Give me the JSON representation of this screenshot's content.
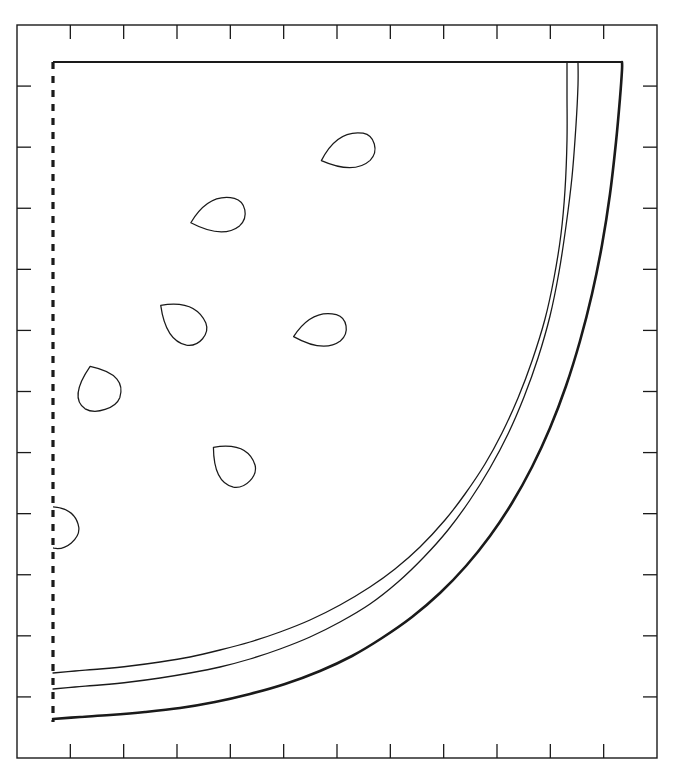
{
  "figure": {
    "title": "",
    "background_color": "#ffffff",
    "line_color": "#1a1a1a",
    "frame": {
      "x0": 17,
      "y0": 25,
      "x1": 657,
      "y1": 758,
      "stroke_width": 1.4
    },
    "axes": {
      "top": {
        "tick_count": 11,
        "tick_length": 14,
        "direction": "inward"
      },
      "bottom": {
        "tick_count": 11,
        "tick_length": 14,
        "direction": "inward"
      },
      "left": {
        "tick_count": 11,
        "tick_length": 14,
        "direction": "inward"
      },
      "right": {
        "tick_count": 11,
        "tick_length": 14,
        "direction": "inward"
      }
    },
    "boundary": {
      "dashed_left_edge": {
        "x": 53,
        "y_top": 62,
        "y_bottom": 722,
        "dash": "7 7",
        "stroke_width": 3.2
      },
      "solid_top_edge": {
        "y": 62,
        "x_left": 53,
        "x_right": 622,
        "stroke_width": 1.8
      }
    }
  },
  "chart_data": {
    "type": "line",
    "title": "",
    "xlabel": "",
    "ylabel": "",
    "xlim": [
      0,
      10
    ],
    "ylim": [
      0,
      10
    ],
    "grid": false,
    "legend": "none",
    "tick_labels": {
      "x": [],
      "y": []
    },
    "series": [
      {
        "name": "curve-inner",
        "stroke_width": 1.3,
        "points": [
          [
            53,
            673
          ],
          [
            75,
            671
          ],
          [
            100,
            669
          ],
          [
            130,
            666
          ],
          [
            160,
            662
          ],
          [
            190,
            657
          ],
          [
            220,
            650
          ],
          [
            250,
            642
          ],
          [
            280,
            632
          ],
          [
            310,
            620
          ],
          [
            340,
            605
          ],
          [
            370,
            587
          ],
          [
            395,
            569
          ],
          [
            420,
            547
          ],
          [
            445,
            520
          ],
          [
            465,
            494
          ],
          [
            485,
            464
          ],
          [
            502,
            433
          ],
          [
            518,
            398
          ],
          [
            532,
            361
          ],
          [
            545,
            319
          ],
          [
            554,
            278
          ],
          [
            561,
            234
          ],
          [
            565,
            190
          ],
          [
            567,
            140
          ],
          [
            567,
            95
          ],
          [
            567,
            62
          ]
        ]
      },
      {
        "name": "curve-middle",
        "stroke_width": 1.3,
        "points": [
          [
            53,
            689
          ],
          [
            75,
            687
          ],
          [
            100,
            685
          ],
          [
            130,
            682
          ],
          [
            160,
            678
          ],
          [
            190,
            673
          ],
          [
            220,
            667
          ],
          [
            250,
            659
          ],
          [
            280,
            649
          ],
          [
            310,
            637
          ],
          [
            340,
            622
          ],
          [
            370,
            604
          ],
          [
            398,
            582
          ],
          [
            424,
            557
          ],
          [
            448,
            530
          ],
          [
            470,
            500
          ],
          [
            490,
            468
          ],
          [
            508,
            434
          ],
          [
            524,
            397
          ],
          [
            538,
            358
          ],
          [
            550,
            316
          ],
          [
            559,
            272
          ],
          [
            566,
            226
          ],
          [
            572,
            177
          ],
          [
            576,
            125
          ],
          [
            578,
            85
          ],
          [
            578,
            62
          ]
        ]
      },
      {
        "name": "curve-outer",
        "stroke_width": 2.6,
        "points": [
          [
            53,
            719
          ],
          [
            80,
            717
          ],
          [
            110,
            715
          ],
          [
            145,
            712
          ],
          [
            180,
            708
          ],
          [
            215,
            702
          ],
          [
            250,
            694
          ],
          [
            285,
            684
          ],
          [
            320,
            671
          ],
          [
            352,
            656
          ],
          [
            382,
            638
          ],
          [
            412,
            617
          ],
          [
            440,
            593
          ],
          [
            466,
            566
          ],
          [
            490,
            536
          ],
          [
            512,
            503
          ],
          [
            532,
            467
          ],
          [
            550,
            428
          ],
          [
            566,
            386
          ],
          [
            580,
            341
          ],
          [
            592,
            294
          ],
          [
            602,
            245
          ],
          [
            610,
            194
          ],
          [
            616,
            142
          ],
          [
            620,
            98
          ],
          [
            622,
            70
          ],
          [
            622,
            62
          ]
        ]
      }
    ],
    "markers": [
      {
        "name": "seed-1",
        "cx": 348,
        "cy": 152,
        "rx": 28,
        "ry": 20,
        "rotation": -18,
        "clipped": false
      },
      {
        "name": "seed-2",
        "cx": 218,
        "cy": 216,
        "rx": 28,
        "ry": 20,
        "rotation": -14,
        "clipped": false
      },
      {
        "name": "seed-3",
        "cx": 182,
        "cy": 322,
        "rx": 27,
        "ry": 21,
        "rotation": 38,
        "clipped": false
      },
      {
        "name": "seed-4",
        "cx": 320,
        "cy": 331,
        "rx": 27,
        "ry": 19,
        "rotation": -12,
        "clipped": false
      },
      {
        "name": "seed-5",
        "cx": 98,
        "cy": 388,
        "rx": 23,
        "ry": 26,
        "rotation": 70,
        "clipped": false
      },
      {
        "name": "seed-6",
        "cx": 232,
        "cy": 464,
        "rx": 25,
        "ry": 22,
        "rotation": 42,
        "clipped": false
      },
      {
        "name": "seed-7",
        "cx": 56,
        "cy": 525,
        "rx": 24,
        "ry": 23,
        "rotation": 48,
        "clipped": true
      }
    ]
  }
}
